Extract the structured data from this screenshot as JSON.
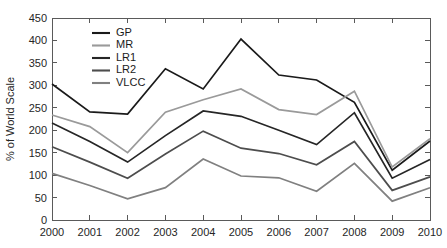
{
  "chart_data": {
    "type": "line",
    "title": "",
    "xlabel": "",
    "ylabel": "% of World Scale",
    "xlim": [
      2000,
      2010
    ],
    "ylim": [
      0,
      450
    ],
    "ytick_step": 50,
    "grid": false,
    "legend_position": "top-left",
    "x": [
      2000,
      2001,
      2002,
      2003,
      2004,
      2005,
      2006,
      2007,
      2008,
      2009,
      2010
    ],
    "categories": [
      "2000",
      "2001",
      "2002",
      "2003",
      "2004",
      "2005",
      "2006",
      "2007",
      "2008",
      "2009",
      "2010"
    ],
    "ytick_labels": [
      "0",
      "50",
      "100",
      "150",
      "200",
      "250",
      "300",
      "350",
      "400",
      "450"
    ],
    "ytick_values": [
      0,
      50,
      100,
      150,
      200,
      250,
      300,
      350,
      400,
      450
    ],
    "series": [
      {
        "name": "GP",
        "color": "#1a1a1a",
        "values": [
          303,
          241,
          236,
          337,
          292,
          403,
          323,
          312,
          262,
          111,
          176
        ]
      },
      {
        "name": "MR",
        "color": "#9a9a9a",
        "values": [
          234,
          208,
          150,
          240,
          268,
          292,
          246,
          235,
          287,
          118,
          181
        ]
      },
      {
        "name": "LR1",
        "color": "#262626",
        "values": [
          216,
          175,
          129,
          188,
          243,
          231,
          200,
          168,
          239,
          93,
          135
        ]
      },
      {
        "name": "LR2",
        "color": "#4d4d4d",
        "values": [
          163,
          129,
          93,
          147,
          198,
          160,
          148,
          123,
          175,
          66,
          96
        ]
      },
      {
        "name": "VLCC",
        "color": "#808080",
        "values": [
          104,
          77,
          47,
          72,
          136,
          98,
          94,
          64,
          126,
          42,
          72
        ]
      }
    ]
  },
  "legend": {
    "entries": [
      {
        "label": "GP"
      },
      {
        "label": "MR"
      },
      {
        "label": "LR1"
      },
      {
        "label": "LR2"
      },
      {
        "label": "VLCC"
      }
    ]
  },
  "axes": {
    "y_title": "% of World Scale",
    "axis_color": "#5a5a5a",
    "background": "#ffffff"
  }
}
